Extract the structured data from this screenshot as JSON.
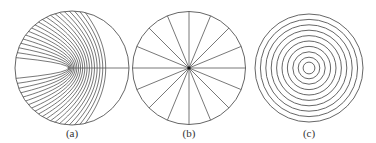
{
  "figure": {
    "panels": [
      {
        "id": "a",
        "label": "(a)",
        "description": "Circle filled with confocal parabolic curves opening to the left, focus point right of center",
        "center": [
          72,
          68
        ],
        "radius": 57,
        "focus": [
          68,
          68
        ],
        "curve_count": 20
      },
      {
        "id": "b",
        "label": "(b)",
        "description": "Circle divided by radial spokes from the center",
        "center": [
          189,
          68
        ],
        "radius": 56.5,
        "spoke_count": 16
      },
      {
        "id": "c",
        "label": "(c)",
        "description": "Concentric circles",
        "center": [
          309,
          68
        ],
        "radius": 54,
        "ring_count": 10
      }
    ],
    "stroke_color": "#555555",
    "background": "#ffffff"
  }
}
